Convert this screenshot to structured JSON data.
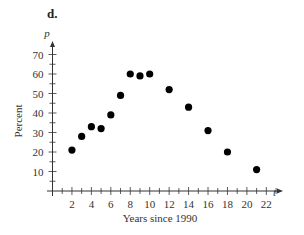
{
  "panel_label": "d.",
  "chart_data": {
    "type": "scatter",
    "title": "",
    "xlabel": "Years since 1990",
    "ylabel": "Percent",
    "x_var": "t",
    "y_var": "p",
    "xlim": [
      0,
      23
    ],
    "ylim": [
      0,
      75
    ],
    "x_ticks": [
      2,
      4,
      6,
      8,
      10,
      12,
      14,
      16,
      18,
      20,
      22
    ],
    "y_ticks": [
      10,
      20,
      30,
      40,
      50,
      60,
      70
    ],
    "grid": false,
    "legend": null,
    "series": [
      {
        "name": "Percent",
        "points": [
          {
            "x": 2,
            "y": 21
          },
          {
            "x": 3,
            "y": 28
          },
          {
            "x": 4,
            "y": 33
          },
          {
            "x": 5,
            "y": 32
          },
          {
            "x": 6,
            "y": 39
          },
          {
            "x": 7,
            "y": 49
          },
          {
            "x": 8,
            "y": 60
          },
          {
            "x": 9,
            "y": 59
          },
          {
            "x": 10,
            "y": 60
          },
          {
            "x": 12,
            "y": 52
          },
          {
            "x": 14,
            "y": 43
          },
          {
            "x": 16,
            "y": 31
          },
          {
            "x": 18,
            "y": 20
          },
          {
            "x": 21,
            "y": 11
          }
        ]
      }
    ]
  }
}
